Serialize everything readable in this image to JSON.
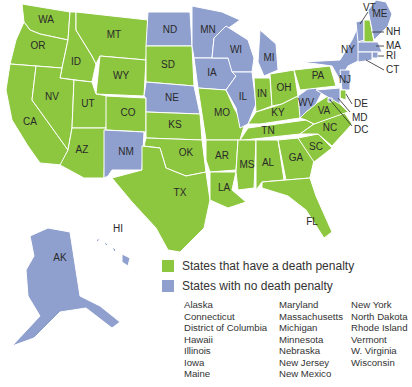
{
  "colors": {
    "death_penalty": "#8dc63f",
    "no_death_penalty": "#8fa0cf",
    "border": "#ffffff"
  },
  "legend": {
    "death_penalty_label": "States that have a death penalty",
    "no_death_penalty_label": "States with no death penalty",
    "no_death_penalty_list": [
      [
        "Alaska",
        "Connecticut",
        "District of Columbia",
        "Hawaii",
        "Illinois",
        "Iowa",
        "Maine"
      ],
      [
        "Maryland",
        "Massachusetts",
        "Michigan",
        "Minnesota",
        "Nebraska",
        "New Jersey",
        "New Mexico"
      ],
      [
        "New York",
        "North Dakota",
        "Rhode Island",
        "Vermont",
        "W. Virginia",
        "Wisconsin"
      ]
    ]
  },
  "states": [
    {
      "abbr": "WA",
      "status": "death"
    },
    {
      "abbr": "OR",
      "status": "death"
    },
    {
      "abbr": "CA",
      "status": "death"
    },
    {
      "abbr": "ID",
      "status": "death"
    },
    {
      "abbr": "NV",
      "status": "death"
    },
    {
      "abbr": "MT",
      "status": "death"
    },
    {
      "abbr": "WY",
      "status": "death"
    },
    {
      "abbr": "UT",
      "status": "death"
    },
    {
      "abbr": "AZ",
      "status": "death"
    },
    {
      "abbr": "CO",
      "status": "death"
    },
    {
      "abbr": "NM",
      "status": "none"
    },
    {
      "abbr": "ND",
      "status": "none"
    },
    {
      "abbr": "SD",
      "status": "death"
    },
    {
      "abbr": "NE",
      "status": "none"
    },
    {
      "abbr": "KS",
      "status": "death"
    },
    {
      "abbr": "OK",
      "status": "death"
    },
    {
      "abbr": "TX",
      "status": "death"
    },
    {
      "abbr": "MN",
      "status": "none"
    },
    {
      "abbr": "IA",
      "status": "none"
    },
    {
      "abbr": "MO",
      "status": "death"
    },
    {
      "abbr": "AR",
      "status": "death"
    },
    {
      "abbr": "LA",
      "status": "death"
    },
    {
      "abbr": "WI",
      "status": "none"
    },
    {
      "abbr": "IL",
      "status": "none"
    },
    {
      "abbr": "MI",
      "status": "none"
    },
    {
      "abbr": "IN",
      "status": "death"
    },
    {
      "abbr": "OH",
      "status": "death"
    },
    {
      "abbr": "KY",
      "status": "death"
    },
    {
      "abbr": "TN",
      "status": "death"
    },
    {
      "abbr": "MS",
      "status": "death"
    },
    {
      "abbr": "AL",
      "status": "death"
    },
    {
      "abbr": "GA",
      "status": "death"
    },
    {
      "abbr": "FL",
      "status": "death"
    },
    {
      "abbr": "SC",
      "status": "death"
    },
    {
      "abbr": "NC",
      "status": "death"
    },
    {
      "abbr": "VA",
      "status": "death"
    },
    {
      "abbr": "WV",
      "status": "none"
    },
    {
      "abbr": "PA",
      "status": "death"
    },
    {
      "abbr": "NY",
      "status": "none"
    },
    {
      "abbr": "VT",
      "status": "none"
    },
    {
      "abbr": "NH",
      "status": "death"
    },
    {
      "abbr": "ME",
      "status": "none"
    },
    {
      "abbr": "MA",
      "status": "none"
    },
    {
      "abbr": "RI",
      "status": "none"
    },
    {
      "abbr": "CT",
      "status": "none"
    },
    {
      "abbr": "NJ",
      "status": "none"
    },
    {
      "abbr": "DE",
      "status": "death"
    },
    {
      "abbr": "MD",
      "status": "none"
    },
    {
      "abbr": "DC",
      "status": "none"
    },
    {
      "abbr": "AK",
      "status": "none"
    },
    {
      "abbr": "HI",
      "status": "none"
    }
  ]
}
